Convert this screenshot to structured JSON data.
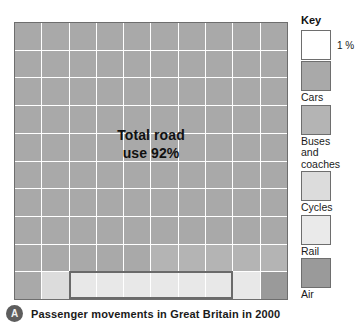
{
  "caption": {
    "badge_letter": "A",
    "text": "Passenger movements in Great Britain in 2000"
  },
  "annotation": {
    "line1": "Total road",
    "line2": "use 92%"
  },
  "legend": {
    "title": "Key",
    "unit_label": "1 %",
    "entries": [
      {
        "label": "Cars",
        "swatch": "s-cars",
        "color": "#a9a9a9"
      },
      {
        "label": "Buses\nand\ncoaches",
        "swatch": "s-buses",
        "color": "#b4b4b4"
      },
      {
        "label": "Cycles",
        "swatch": "s-cycles",
        "color": "#dcdcdc"
      },
      {
        "label": "Rail",
        "swatch": "s-rail",
        "color": "#eaeaea"
      },
      {
        "label": "Air",
        "swatch": "s-air",
        "color": "#9a9a9a"
      }
    ]
  },
  "colors": {
    "cars": "#a9a9a9",
    "buses": "#b4b4b4",
    "cycles": "#dcdcdc",
    "rail": "#e8e8e8",
    "air": "#9a9a9a",
    "gridline": "#ffffff",
    "border": "#6e6e6e",
    "text": "#1a1a1a"
  },
  "chart_data": {
    "type": "waffle",
    "title": "Passenger movements in Great Britain in 2000",
    "unit": "1 %",
    "grid": {
      "rows": 10,
      "cols": 10,
      "total_cells": 100
    },
    "categories": [
      "Cars",
      "Buses and coaches",
      "Cycles",
      "Rail",
      "Air"
    ],
    "values": [
      86,
      6,
      1,
      6,
      1
    ],
    "value_unit": "percent",
    "annotations": [
      "Total road use 92%"
    ],
    "legend_position": "right",
    "grid_on": true,
    "cell_classes": [
      [
        "c-cars",
        "c-cars",
        "c-cars",
        "c-cars",
        "c-cars",
        "c-cars",
        "c-cars",
        "c-cars",
        "c-cars",
        "c-cars"
      ],
      [
        "c-cars",
        "c-cars",
        "c-cars",
        "c-cars",
        "c-cars",
        "c-cars",
        "c-cars",
        "c-cars",
        "c-cars",
        "c-cars"
      ],
      [
        "c-cars",
        "c-cars",
        "c-cars",
        "c-cars",
        "c-cars",
        "c-cars",
        "c-cars",
        "c-cars",
        "c-cars",
        "c-cars"
      ],
      [
        "c-cars",
        "c-cars",
        "c-cars",
        "c-cars",
        "c-cars",
        "c-cars",
        "c-cars",
        "c-cars",
        "c-cars",
        "c-cars"
      ],
      [
        "c-cars",
        "c-cars",
        "c-cars",
        "c-cars",
        "c-cars",
        "c-cars",
        "c-cars",
        "c-cars",
        "c-cars",
        "c-cars"
      ],
      [
        "c-cars",
        "c-cars",
        "c-cars",
        "c-cars",
        "c-cars",
        "c-cars",
        "c-cars",
        "c-cars",
        "c-cars",
        "c-cars"
      ],
      [
        "c-cars",
        "c-cars",
        "c-cars",
        "c-cars",
        "c-cars",
        "c-cars",
        "c-cars",
        "c-cars",
        "c-cars",
        "c-cars"
      ],
      [
        "c-cars",
        "c-cars",
        "c-cars",
        "c-cars",
        "c-cars",
        "c-cars",
        "c-cars",
        "c-cars",
        "c-cars",
        "c-cars"
      ],
      [
        "c-cars",
        "c-cars",
        "c-cars",
        "c-cars",
        "c-cars",
        "c-buses",
        "c-buses",
        "c-buses",
        "c-buses",
        "c-buses"
      ],
      [
        "c-cars",
        "c-cycles",
        "c-rail",
        "c-rail",
        "c-rail",
        "c-rail",
        "c-rail",
        "c-rail",
        "c-rail",
        "c-air"
      ]
    ]
  }
}
